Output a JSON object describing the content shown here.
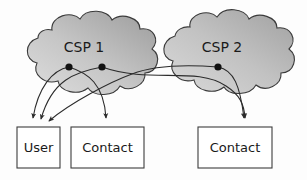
{
  "diagram": {
    "background_color": "#fdfdfd",
    "stroke_color": "#2b2b2b",
    "clouds": [
      {
        "id": "csp-1",
        "label": "CSP 1",
        "label_x": 84,
        "label_y": 48,
        "fill_light": "#d9d9d9",
        "fill_dark": "#9a9a9a",
        "endpoints": [
          {
            "id": "csp1-dot-a",
            "x": 69,
            "y": 67
          },
          {
            "id": "csp1-dot-b",
            "x": 102,
            "y": 67
          }
        ]
      },
      {
        "id": "csp-2",
        "label": "CSP 2",
        "label_x": 222,
        "label_y": 48,
        "fill_light": "#d4d4d4",
        "fill_dark": "#9e9e9e",
        "endpoints": [
          {
            "id": "csp2-dot-a",
            "x": 218,
            "y": 67
          }
        ]
      }
    ],
    "boxes": [
      {
        "id": "box-user",
        "label": "User",
        "x": 17,
        "y": 127,
        "width": 43,
        "height": 41
      },
      {
        "id": "box-contact-left",
        "label": "Contact",
        "x": 71,
        "y": 127,
        "width": 73,
        "height": 41
      },
      {
        "id": "box-contact-right",
        "label": "Contact",
        "x": 198,
        "y": 127,
        "width": 74,
        "height": 41
      }
    ],
    "edges": [
      {
        "id": "edge-csp1a-user",
        "from": "csp1-dot-a",
        "to": "box-user",
        "arrow": true
      },
      {
        "id": "edge-csp1b-user",
        "from": "csp1-dot-b",
        "to": "box-user",
        "arrow": true
      },
      {
        "id": "edge-csp2a-user",
        "from": "csp2-dot-a",
        "to": "box-user",
        "arrow": true
      },
      {
        "id": "edge-csp1a-contact-left",
        "from": "csp1-dot-a",
        "to": "box-contact-left",
        "arrow": true
      },
      {
        "id": "edge-csp1b-contact-right",
        "from": "csp1-dot-b",
        "to": "box-contact-right",
        "arrow": true
      },
      {
        "id": "edge-csp2a-contact-right",
        "from": "csp2-dot-a",
        "to": "box-contact-right",
        "arrow": true
      }
    ]
  }
}
